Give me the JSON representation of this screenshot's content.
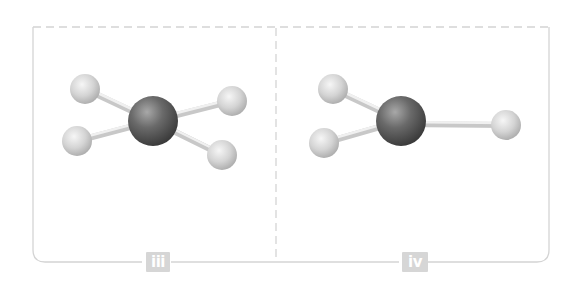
{
  "diagram": {
    "panels": [
      {
        "label": "iii",
        "description": "Square-planar style ball-and-stick model: one dark central atom bonded to four light atoms",
        "central_atom": {
          "cx": 153,
          "cy": 121,
          "r": 25
        },
        "ligands": [
          {
            "cx": 85,
            "cy": 89,
            "r": 15
          },
          {
            "cx": 232,
            "cy": 101,
            "r": 15
          },
          {
            "cx": 77,
            "cy": 141,
            "r": 15
          },
          {
            "cx": 222,
            "cy": 155,
            "r": 15
          }
        ]
      },
      {
        "label": "iv",
        "description": "Ball-and-stick model: one dark central atom bonded to three light atoms",
        "central_atom": {
          "cx": 401,
          "cy": 121,
          "r": 25
        },
        "ligands": [
          {
            "cx": 333,
            "cy": 89,
            "r": 15
          },
          {
            "cx": 506,
            "cy": 125,
            "r": 15
          },
          {
            "cx": 324,
            "cy": 143,
            "r": 15
          }
        ]
      }
    ],
    "colors": {
      "frame": "#d4d4d4",
      "label_bg": "#d6d6d6",
      "label_text": "#ffffff",
      "central_atom": "#5a5a5a",
      "ligand_atom": "#d8d8d8",
      "bond": "#e0e0e0"
    }
  }
}
